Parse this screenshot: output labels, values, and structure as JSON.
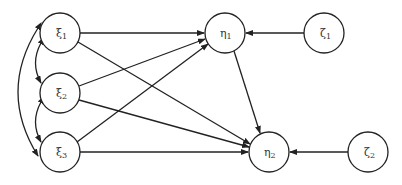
{
  "diagram": {
    "type": "path-diagram",
    "nodes": [
      {
        "id": "xi1",
        "symbol": "ξ",
        "sub": "1",
        "cx": 60,
        "cy": 33
      },
      {
        "id": "xi2",
        "symbol": "ξ",
        "sub": "2",
        "cx": 60,
        "cy": 93
      },
      {
        "id": "xi3",
        "symbol": "ξ",
        "sub": "3",
        "cx": 60,
        "cy": 152
      },
      {
        "id": "eta1",
        "symbol": "η",
        "sub": "1",
        "cx": 225,
        "cy": 33
      },
      {
        "id": "eta2",
        "symbol": "η",
        "sub": "2",
        "cx": 269,
        "cy": 152
      },
      {
        "id": "zeta1",
        "symbol": "ζ",
        "sub": "1",
        "cx": 324,
        "cy": 33
      },
      {
        "id": "zeta2",
        "symbol": "ζ",
        "sub": "2",
        "cx": 368,
        "cy": 152
      }
    ],
    "radius": 20,
    "edges": [
      {
        "from": "xi1",
        "to": "eta1",
        "kind": "directed"
      },
      {
        "from": "xi1",
        "to": "eta2",
        "kind": "directed"
      },
      {
        "from": "xi2",
        "to": "eta1",
        "kind": "directed"
      },
      {
        "from": "xi2",
        "to": "eta2",
        "kind": "directed"
      },
      {
        "from": "xi3",
        "to": "eta1",
        "kind": "directed"
      },
      {
        "from": "xi3",
        "to": "eta2",
        "kind": "directed"
      },
      {
        "from": "eta1",
        "to": "eta2",
        "kind": "directed"
      },
      {
        "from": "zeta1",
        "to": "eta1",
        "kind": "directed"
      },
      {
        "from": "zeta2",
        "to": "eta2",
        "kind": "directed"
      },
      {
        "from": "xi1",
        "to": "xi2",
        "kind": "covariance"
      },
      {
        "from": "xi2",
        "to": "xi3",
        "kind": "covariance"
      },
      {
        "from": "xi1",
        "to": "xi3",
        "kind": "covariance"
      }
    ]
  },
  "labels": {
    "xi1": "ξ",
    "xi1_sub": "1",
    "xi2": "ξ",
    "xi2_sub": "2",
    "xi3": "ξ",
    "xi3_sub": "3",
    "eta1": "η",
    "eta1_sub": "1",
    "eta2": "η",
    "eta2_sub": "2",
    "zeta1": "ζ",
    "zeta1_sub": "1",
    "zeta2": "ζ",
    "zeta2_sub": "2"
  },
  "colors": {
    "stroke": "#222222",
    "background": "#ffffff"
  }
}
